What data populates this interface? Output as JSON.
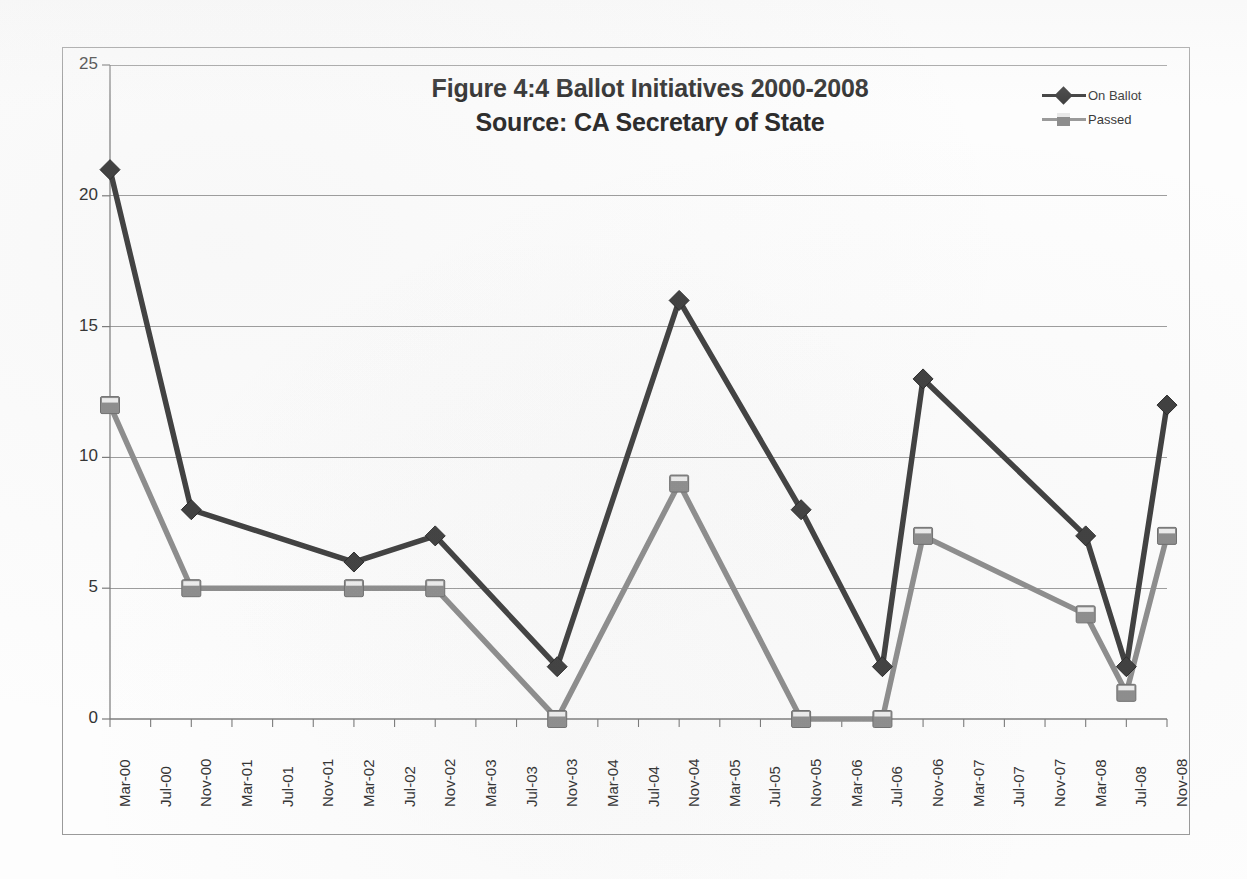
{
  "chart_data": {
    "type": "line",
    "title": "Figure 4:4 Ballot Initiatives 2000-2008",
    "subtitle": "Source: CA Secretary of State",
    "xlabel": "",
    "ylabel": "",
    "ylim": [
      0,
      25
    ],
    "yticks": [
      0,
      5,
      10,
      15,
      20,
      25
    ],
    "grid": true,
    "legend_position": "top-right",
    "categories": [
      "Mar-00",
      "Jul-00",
      "Nov-00",
      "Mar-01",
      "Jul-01",
      "Nov-01",
      "Mar-02",
      "Jul-02",
      "Nov-02",
      "Mar-03",
      "Jul-03",
      "Nov-03",
      "Mar-04",
      "Jul-04",
      "Nov-04",
      "Mar-05",
      "Jul-05",
      "Nov-05",
      "Mar-06",
      "Jul-06",
      "Nov-06",
      "Mar-07",
      "Jul-07",
      "Nov-07",
      "Mar-08",
      "Jul-08",
      "Nov-08"
    ],
    "series": [
      {
        "name": "On Ballot",
        "color": "#3f3f3f",
        "marker": "diamond",
        "points": [
          {
            "x": "Mar-00",
            "y": 21
          },
          {
            "x": "Nov-00",
            "y": 8
          },
          {
            "x": "Mar-02",
            "y": 6
          },
          {
            "x": "Nov-02",
            "y": 7
          },
          {
            "x": "Nov-03",
            "y": 2
          },
          {
            "x": "Nov-04",
            "y": 16
          },
          {
            "x": "Nov-05",
            "y": 8
          },
          {
            "x": "Jul-06",
            "y": 2
          },
          {
            "x": "Nov-06",
            "y": 13
          },
          {
            "x": "Mar-08",
            "y": 7
          },
          {
            "x": "Jul-08",
            "y": 2
          },
          {
            "x": "Nov-08",
            "y": 12
          }
        ]
      },
      {
        "name": "Passed",
        "color": "#8d8d8d",
        "marker": "square",
        "points": [
          {
            "x": "Mar-00",
            "y": 12
          },
          {
            "x": "Nov-00",
            "y": 5
          },
          {
            "x": "Mar-02",
            "y": 5
          },
          {
            "x": "Nov-02",
            "y": 5
          },
          {
            "x": "Nov-03",
            "y": 0
          },
          {
            "x": "Nov-04",
            "y": 9
          },
          {
            "x": "Nov-05",
            "y": 0
          },
          {
            "x": "Jul-06",
            "y": 0
          },
          {
            "x": "Nov-06",
            "y": 7
          },
          {
            "x": "Mar-08",
            "y": 4
          },
          {
            "x": "Jul-08",
            "y": 1
          },
          {
            "x": "Nov-08",
            "y": 7
          }
        ]
      }
    ]
  },
  "legend": {
    "items": [
      {
        "label": "On Ballot"
      },
      {
        "label": "Passed"
      }
    ]
  },
  "colors": {
    "on_ballot": "#3f3f3f",
    "passed": "#8d8d8d",
    "grid": "#9d9d9d",
    "axis": "#7a7a7a",
    "text": "#333333",
    "frame": "#9a9a9a"
  }
}
